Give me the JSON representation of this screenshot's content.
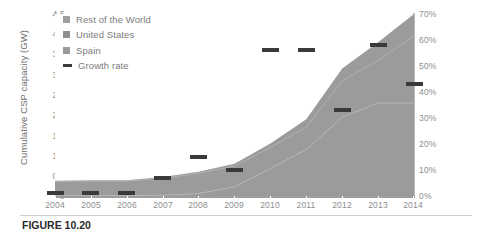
{
  "chart_data": {
    "type": "area",
    "title": "",
    "xlabel": "",
    "ylabel": "Cumulative CSP capacity (GW)",
    "y2label": "",
    "categories": [
      "2004",
      "2005",
      "2006",
      "2007",
      "2008",
      "2009",
      "2010",
      "2011",
      "2012",
      "2013",
      "2014"
    ],
    "ylim": [
      0,
      4.5
    ],
    "yticks": [
      "0",
      "0.5",
      "1.0",
      "1.5",
      "2.0",
      "2.5",
      "3.0",
      "3.5",
      "4.0",
      "4.5"
    ],
    "ytick_values": [
      0,
      0.5,
      1.0,
      1.5,
      2.0,
      2.5,
      3.0,
      3.5,
      4.0,
      4.5
    ],
    "y2lim": [
      0,
      70
    ],
    "y2ticks": [
      "0%",
      "10%",
      "20%",
      "30%",
      "40%",
      "50%",
      "60%",
      "70%"
    ],
    "y2tick_values": [
      0,
      10,
      20,
      30,
      40,
      50,
      60,
      70
    ],
    "grid": false,
    "legend_position": "top-left",
    "stacked": true,
    "series": [
      {
        "name": "Spain",
        "color": "#9a9a9a",
        "values": [
          0.01,
          0.01,
          0.01,
          0.02,
          0.06,
          0.23,
          0.68,
          1.15,
          1.95,
          2.3,
          2.3
        ]
      },
      {
        "name": "United States",
        "color": "#8f8f8f",
        "values": [
          0.35,
          0.36,
          0.36,
          0.42,
          0.5,
          0.51,
          0.52,
          0.55,
          0.9,
          1.05,
          1.65
        ]
      },
      {
        "name": "Rest of the World",
        "color": "#9e9e9e",
        "values": [
          0.02,
          0.02,
          0.02,
          0.03,
          0.04,
          0.06,
          0.1,
          0.2,
          0.3,
          0.45,
          0.55
        ]
      }
    ],
    "growth_series": {
      "name": "Growth rate",
      "color": "#3a3a3a",
      "marker": "dash",
      "unit": "%",
      "values": [
        1,
        1,
        1,
        7,
        15,
        10,
        56,
        56,
        33,
        58,
        43
      ]
    },
    "annotations": []
  },
  "legend": {
    "items": [
      {
        "label": "Rest of the World",
        "type": "swatch",
        "color": "#9e9e9e"
      },
      {
        "label": "United States",
        "type": "swatch",
        "color": "#8f8f8f"
      },
      {
        "label": "Spain",
        "type": "swatch",
        "color": "#9a9a9a"
      },
      {
        "label": "Growth rate",
        "type": "dash",
        "color": "#3a3a3a"
      }
    ]
  },
  "axes": {
    "y_title": "Cumulative CSP capacity (GW)"
  },
  "caption": {
    "label": "FIGURE 10.20",
    "text": ""
  }
}
